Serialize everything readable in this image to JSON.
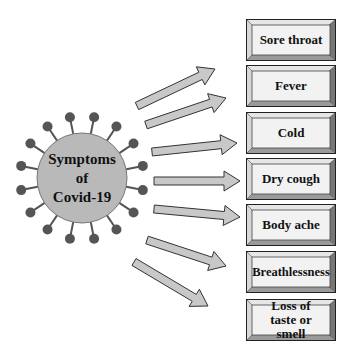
{
  "center": {
    "label_lines": [
      "Symptoms",
      "of",
      "Covid-19"
    ],
    "fill_color": "#b9b9b9",
    "spike_color": "#555555"
  },
  "symptoms": [
    {
      "label": "Sore throat"
    },
    {
      "label": "Fever"
    },
    {
      "label": "Cold"
    },
    {
      "label": "Dry cough"
    },
    {
      "label": "Body ache"
    },
    {
      "label": "Breathlessness"
    },
    {
      "label": "Loss of taste or smell"
    }
  ],
  "colors": {
    "arrow_fill": "#c8c8c8",
    "arrow_stroke": "#333333",
    "box_face": "#f2f2f2",
    "box_bevel_light": "#e6e6e6",
    "box_bevel_dark": "#777777"
  }
}
